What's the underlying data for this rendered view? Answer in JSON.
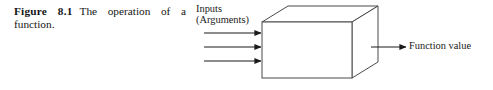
{
  "figure": {
    "number_label": "Figure 8.1",
    "caption_text": "The operation of a function.",
    "caption_full": "Figure 8.1 The operation of a function."
  },
  "diagram": {
    "type": "block-diagram",
    "shape": "3d-box",
    "box_label": "Function",
    "inputs": {
      "label_line1": "Inputs",
      "label_line2": "(Arguments)",
      "arrow_count": 3,
      "direction": "right"
    },
    "output": {
      "label": "Function value",
      "arrow_count": 1,
      "direction": "right"
    },
    "colors": {
      "stroke": "#4a4a4a",
      "arrow": "#1a1a1a",
      "background": "#ffffff",
      "text": "#1a1a1a"
    }
  }
}
